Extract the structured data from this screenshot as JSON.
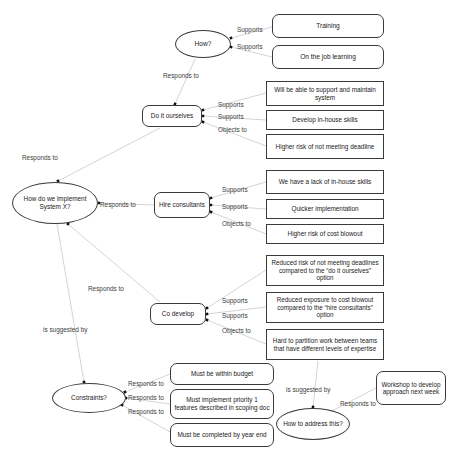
{
  "diagram": {
    "caption": "Figure 1. An IBIS-style map",
    "stroke_color": "#3a3a3a",
    "text_color": "#1a1a1a",
    "background": "#ffffff",
    "nodes": [
      {
        "id": "how",
        "label": "How?",
        "shape": "ellipse",
        "x": 175,
        "y": 30,
        "w": 56,
        "h": 28,
        "font": 6.6
      },
      {
        "id": "training",
        "label": "Training",
        "shape": "rounded",
        "x": 272,
        "y": 14,
        "w": 112,
        "h": 24,
        "font": 6.6
      },
      {
        "id": "onjob",
        "label": "On the job learning",
        "shape": "rounded",
        "x": 272,
        "y": 45,
        "w": 112,
        "h": 24,
        "font": 6.6
      },
      {
        "id": "doit",
        "label": "Do it ourselves",
        "shape": "rounded",
        "x": 142,
        "y": 105,
        "w": 60,
        "h": 22,
        "font": 6.4
      },
      {
        "id": "support",
        "label": "Will be able to support and maintain system",
        "shape": "rect",
        "x": 266,
        "y": 81,
        "w": 118,
        "h": 25,
        "font": 6.4
      },
      {
        "id": "inhouse",
        "label": "Develop in-house skills",
        "shape": "rect",
        "x": 266,
        "y": 110,
        "w": 118,
        "h": 20,
        "font": 6.4
      },
      {
        "id": "riskdeadline",
        "label": "Higher risk of not meeting deadline",
        "shape": "rect",
        "x": 266,
        "y": 134,
        "w": 118,
        "h": 25,
        "font": 6.4
      },
      {
        "id": "central",
        "label": "How do we implement System X?",
        "shape": "ellipse",
        "x": 12,
        "y": 182,
        "w": 86,
        "h": 42,
        "font": 6.4
      },
      {
        "id": "hire",
        "label": "Hire consultants",
        "shape": "rounded",
        "x": 154,
        "y": 192,
        "w": 56,
        "h": 26,
        "font": 6.4
      },
      {
        "id": "lackskills",
        "label": "We have a lack of in-house skills",
        "shape": "rect",
        "x": 266,
        "y": 170,
        "w": 118,
        "h": 24,
        "font": 6.4
      },
      {
        "id": "quicker",
        "label": "Quicker implementation",
        "shape": "rect",
        "x": 266,
        "y": 199,
        "w": 118,
        "h": 20,
        "font": 6.4
      },
      {
        "id": "costblowout",
        "label": "Higher risk of cost blowout",
        "shape": "rect",
        "x": 266,
        "y": 224,
        "w": 118,
        "h": 20,
        "font": 6.4
      },
      {
        "id": "codevelop",
        "label": "Co develop",
        "shape": "rounded",
        "x": 150,
        "y": 303,
        "w": 56,
        "h": 22,
        "font": 6.4
      },
      {
        "id": "reddeadline",
        "label": "Reduced risk of not meeting deadlines compared to the “do it ourselves” option",
        "shape": "rect",
        "x": 266,
        "y": 255,
        "w": 118,
        "h": 31,
        "font": 6.3
      },
      {
        "id": "redcost",
        "label": "Reduced exposure to cost blowout compared to the “hire consultants” option",
        "shape": "rect",
        "x": 266,
        "y": 292,
        "w": 118,
        "h": 31,
        "font": 6.3
      },
      {
        "id": "partition",
        "label": "Hard to partition work between teams that have different levels of expertise",
        "shape": "rect",
        "x": 266,
        "y": 329,
        "w": 118,
        "h": 31,
        "font": 6.3
      },
      {
        "id": "constraints",
        "label": "Constraints?",
        "shape": "ellipse",
        "x": 52,
        "y": 383,
        "w": 74,
        "h": 30,
        "font": 6.4
      },
      {
        "id": "budget",
        "label": "Must be within budget",
        "shape": "rounded",
        "x": 170,
        "y": 363,
        "w": 104,
        "h": 22,
        "font": 6.4
      },
      {
        "id": "priority",
        "label": "Must implement priority 1 features described in scoping doc",
        "shape": "rounded",
        "x": 170,
        "y": 389,
        "w": 104,
        "h": 30,
        "font": 6.4
      },
      {
        "id": "yearend",
        "label": "Must be completed by year end",
        "shape": "rounded",
        "x": 170,
        "y": 423,
        "w": 104,
        "h": 24,
        "font": 6.4
      },
      {
        "id": "howaddress",
        "label": "How to address this?",
        "shape": "ellipse",
        "x": 276,
        "y": 408,
        "w": 74,
        "h": 32,
        "font": 6.4
      },
      {
        "id": "workshop",
        "label": "Workshop to develop approach next week",
        "shape": "rounded",
        "x": 376,
        "y": 371,
        "w": 70,
        "h": 34,
        "font": 6.3
      }
    ],
    "edge_labels": [
      {
        "id": "how-training-lbl",
        "text": "Supports",
        "x": 237,
        "y": 26
      },
      {
        "id": "how-onjob-lbl",
        "text": "Supports",
        "x": 237,
        "y": 43
      },
      {
        "id": "how-responds-lbl",
        "text": "Responds to",
        "x": 163,
        "y": 72
      },
      {
        "id": "doit-support-lbl",
        "text": "Supports",
        "x": 218,
        "y": 101
      },
      {
        "id": "doit-inhouse-lbl",
        "text": "Supports",
        "x": 218,
        "y": 113
      },
      {
        "id": "doit-risk-lbl",
        "text": "Objects to",
        "x": 218,
        "y": 126
      },
      {
        "id": "doit-central-lbl",
        "text": "Responds to",
        "x": 22,
        "y": 154
      },
      {
        "id": "central-hire-lbl",
        "text": "Responds to",
        "x": 100,
        "y": 201
      },
      {
        "id": "hire-lack-lbl",
        "text": "Supports",
        "x": 222,
        "y": 186
      },
      {
        "id": "hire-quicker-lbl",
        "text": "Supports",
        "x": 222,
        "y": 203
      },
      {
        "id": "hire-cost-lbl",
        "text": "Objects to",
        "x": 222,
        "y": 220
      },
      {
        "id": "central-codev-lbl",
        "text": "Responds to",
        "x": 88,
        "y": 285
      },
      {
        "id": "codev-red1-lbl",
        "text": "Supports",
        "x": 222,
        "y": 297
      },
      {
        "id": "codev-red2-lbl",
        "text": "Supports",
        "x": 222,
        "y": 312
      },
      {
        "id": "codev-partition-lbl",
        "text": "Objects to",
        "x": 222,
        "y": 327
      },
      {
        "id": "constraints-central-lbl",
        "text": "is suggested by",
        "x": 43,
        "y": 326
      },
      {
        "id": "constraints-budget-lbl",
        "text": "Responds to",
        "x": 128,
        "y": 380
      },
      {
        "id": "constraints-prio-lbl",
        "text": "Responds to",
        "x": 128,
        "y": 394
      },
      {
        "id": "constraints-year-lbl",
        "text": "Responds to",
        "x": 128,
        "y": 408
      },
      {
        "id": "partition-how-lbl",
        "text": "is suggested by",
        "x": 286,
        "y": 386
      },
      {
        "id": "how-workshop-lbl",
        "text": "Responds to",
        "x": 340,
        "y": 400
      }
    ]
  }
}
